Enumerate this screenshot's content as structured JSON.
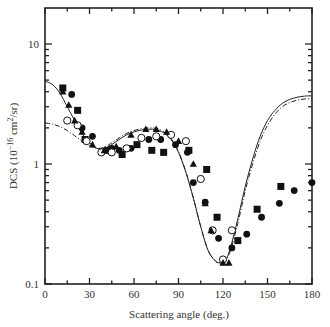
{
  "chart_data": {
    "type": "scatter",
    "title": "",
    "xlabel": "Scattering angle (deg.)",
    "ylabel": "DCS (10^-16 cm^2/sr)",
    "ylabel_parts": {
      "prefix": "DCS (10",
      "exp1": "−16",
      "mid": " cm",
      "exp2": "2",
      "suffix": "/sr)"
    },
    "xlim": [
      0,
      180
    ],
    "ylim": [
      0.1,
      20
    ],
    "yscale": "log",
    "grid": false,
    "legend": null,
    "x_ticks": [
      0,
      30,
      60,
      90,
      120,
      150,
      180
    ],
    "x_tick_labels": [
      "0",
      "30",
      "60",
      "90",
      "120",
      "150",
      "180"
    ],
    "y_ticks": [
      0.1,
      1,
      10
    ],
    "y_tick_labels": [
      "0.1",
      "1",
      "10"
    ],
    "series": [
      {
        "name": "theory-solid",
        "style": "solid-line",
        "x": [
          0,
          5,
          10,
          15,
          20,
          25,
          30,
          35,
          40,
          45,
          50,
          55,
          60,
          65,
          70,
          75,
          80,
          85,
          90,
          95,
          100,
          105,
          110,
          115,
          118,
          120,
          122,
          125,
          130,
          135,
          140,
          145,
          150,
          155,
          160,
          165,
          170,
          175,
          180
        ],
        "y": [
          4.9,
          4.6,
          3.9,
          3.0,
          2.3,
          1.8,
          1.5,
          1.35,
          1.35,
          1.45,
          1.6,
          1.75,
          1.85,
          1.92,
          1.95,
          1.93,
          1.82,
          1.6,
          1.25,
          0.85,
          0.52,
          0.3,
          0.19,
          0.155,
          0.15,
          0.152,
          0.16,
          0.2,
          0.35,
          0.65,
          1.1,
          1.7,
          2.3,
          2.8,
          3.2,
          3.45,
          3.6,
          3.68,
          3.7
        ]
      },
      {
        "name": "theory-dashdot",
        "style": "dash-dot-line",
        "x": [
          0,
          5,
          10,
          15,
          20,
          25,
          30,
          35,
          40,
          45,
          50,
          55,
          60,
          65,
          70,
          75,
          80,
          85,
          90,
          95,
          100,
          105,
          110,
          115,
          118,
          120,
          122,
          125,
          130,
          135,
          140,
          145,
          150,
          155,
          160,
          165,
          170,
          175,
          180
        ],
        "y": [
          2.2,
          2.15,
          2.05,
          1.9,
          1.72,
          1.55,
          1.42,
          1.35,
          1.38,
          1.5,
          1.65,
          1.8,
          1.9,
          1.97,
          2.0,
          1.98,
          1.86,
          1.63,
          1.27,
          0.86,
          0.52,
          0.3,
          0.19,
          0.155,
          0.15,
          0.152,
          0.158,
          0.19,
          0.32,
          0.6,
          1.0,
          1.55,
          2.1,
          2.6,
          3.0,
          3.25,
          3.4,
          3.48,
          3.5
        ]
      },
      {
        "name": "filled-squares",
        "marker": "square-filled",
        "x": [
          12,
          22,
          27,
          42,
          52,
          62,
          72,
          80,
          97,
          109,
          116,
          130,
          143,
          159
        ],
        "y": [
          4.3,
          2.8,
          1.6,
          1.3,
          1.2,
          1.45,
          1.3,
          1.25,
          1.3,
          0.9,
          0.36,
          0.23,
          0.42,
          0.65
        ]
      },
      {
        "name": "filled-circles",
        "marker": "circle-filled",
        "x": [
          18,
          25,
          32,
          45,
          50,
          58,
          70,
          78,
          88,
          96,
          100,
          108,
          117,
          126,
          136,
          146,
          158,
          168,
          180
        ],
        "y": [
          3.8,
          2.0,
          1.7,
          1.35,
          1.3,
          1.35,
          1.6,
          1.6,
          1.45,
          1.25,
          0.7,
          0.48,
          0.24,
          0.2,
          0.26,
          0.36,
          0.47,
          0.6,
          0.7
        ]
      },
      {
        "name": "open-circles",
        "marker": "circle-open",
        "x": [
          15,
          22,
          28,
          38,
          45,
          55,
          65,
          75,
          85,
          95,
          105,
          113,
          120,
          126
        ],
        "y": [
          2.3,
          2.1,
          1.55,
          1.25,
          1.25,
          1.35,
          1.65,
          1.7,
          1.75,
          1.55,
          0.75,
          0.28,
          0.16,
          0.28
        ]
      },
      {
        "name": "filled-triangles",
        "marker": "triangle-filled",
        "x": [
          12,
          16,
          20,
          25,
          32,
          40,
          48,
          58,
          68,
          75,
          82,
          90,
          100,
          108,
          112,
          120,
          124
        ],
        "y": [
          4.0,
          3.1,
          2.3,
          1.85,
          1.45,
          1.3,
          1.4,
          1.75,
          1.95,
          1.95,
          1.85,
          1.55,
          1.0,
          0.47,
          0.28,
          0.15,
          0.15
        ]
      }
    ]
  }
}
